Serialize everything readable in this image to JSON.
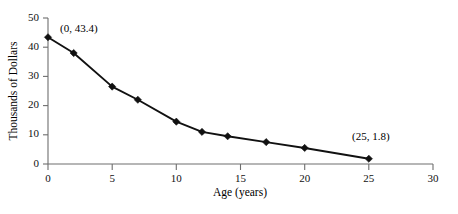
{
  "chart_data": {
    "type": "line",
    "title": "",
    "xlabel": "Age (years)",
    "ylabel": "Thousands of Dollars",
    "xlim": [
      0,
      30
    ],
    "ylim": [
      0,
      50
    ],
    "xticks": [
      0,
      5,
      10,
      15,
      20,
      25,
      30
    ],
    "yticks": [
      0,
      10,
      20,
      30,
      40,
      50
    ],
    "grid": false,
    "legend": false,
    "marker": "diamond",
    "series": [
      {
        "name": "value",
        "x": [
          0,
          2,
          5,
          7,
          10,
          12,
          14,
          17,
          20,
          25
        ],
        "values": [
          43.4,
          38.0,
          26.5,
          22.0,
          14.5,
          11.0,
          9.5,
          7.5,
          5.5,
          1.8
        ]
      }
    ],
    "annotations": [
      {
        "label": "(0, 43.4)",
        "x": 0,
        "y": 43.4
      },
      {
        "label": "(25, 1.8)",
        "x": 25,
        "y": 1.8
      }
    ]
  },
  "axis": {
    "y_tick_labels": [
      "0",
      "10",
      "20",
      "30",
      "40",
      "50"
    ],
    "x_tick_labels": [
      "0",
      "5",
      "10",
      "15",
      "20",
      "25",
      "30"
    ],
    "x_title": "Age (years)",
    "y_title": "Thousands of Dollars"
  },
  "annotations": {
    "first_point": "(0, 43.4)",
    "last_point": "(25, 1.8)"
  },
  "colors": {
    "series": "#111111",
    "axis": "#6e6e6e",
    "background": "#ffffff"
  }
}
